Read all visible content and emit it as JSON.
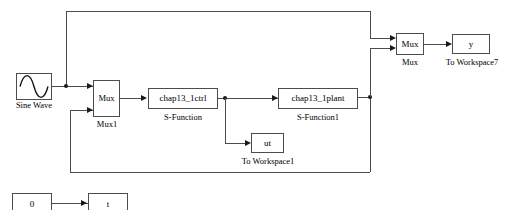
{
  "diagram": {
    "title_ghost": "",
    "line_color": "#4c4c4c",
    "background": "#ffffff",
    "blocks": {
      "sine_wave": {
        "label": "",
        "caption": "Sine Wave",
        "icon": "sine-wave-icon"
      },
      "mux1": {
        "label": "Mux",
        "caption": "Mux1"
      },
      "ctrl": {
        "label": "chap13_1ctrl",
        "caption": "S-Function"
      },
      "plant": {
        "label": "chap13_1plant",
        "caption": "S-Function1"
      },
      "ut": {
        "label": "ut",
        "caption": "To Workspace1"
      },
      "mux2": {
        "label": "Mux",
        "caption": "Mux"
      },
      "y": {
        "label": "y",
        "caption": "To Workspace7"
      },
      "zero": {
        "label": "0",
        "caption": ""
      },
      "t": {
        "label": "t",
        "caption": ""
      }
    }
  }
}
